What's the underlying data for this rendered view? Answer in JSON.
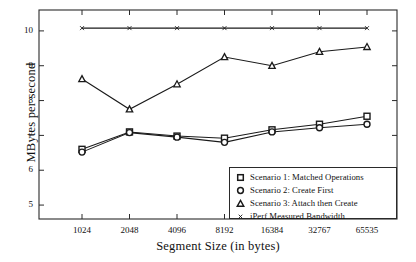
{
  "chart_data": {
    "type": "line",
    "title": "",
    "xlabel": "Segment Size (in bytes)",
    "ylabel": "MBytes per second",
    "categories": [
      "1024",
      "2048",
      "4096",
      "8192",
      "16384",
      "32767",
      "65535"
    ],
    "xticks": [
      "1024",
      "2048",
      "4096",
      "8192",
      "16384",
      "32767",
      "65535"
    ],
    "yticks": [
      "5",
      "6",
      "7",
      "8",
      "9",
      "10"
    ],
    "ylim": [
      4.6,
      10.6
    ],
    "grid": false,
    "legend_position": "lower right",
    "series": [
      {
        "name": "Scenario 1: Matched Operations",
        "marker": "square",
        "values": [
          6.6,
          7.1,
          6.98,
          6.92,
          7.16,
          7.32,
          7.55
        ]
      },
      {
        "name": "Scenario 2: Create First",
        "marker": "circle",
        "values": [
          6.52,
          7.08,
          6.95,
          6.8,
          7.1,
          7.22,
          7.32
        ]
      },
      {
        "name": "Scenario 3: Attach then Create",
        "marker": "triangle",
        "values": [
          8.62,
          7.75,
          8.47,
          9.25,
          9.0,
          9.4,
          9.54
        ]
      },
      {
        "name": "iPerf Measured Bandwidth",
        "marker": "cross",
        "values": [
          10.08,
          10.08,
          10.08,
          10.08,
          10.08,
          10.08,
          10.08
        ]
      }
    ]
  },
  "legend": {
    "entries": [
      {
        "label": "Scenario 1: Matched Operations",
        "marker": "square"
      },
      {
        "label": "Scenario 2: Create First",
        "marker": "circle"
      },
      {
        "label": "Scenario 3: Attach then Create",
        "marker": "triangle"
      },
      {
        "label": "iPerf Measured Bandwidth",
        "marker": "cross"
      }
    ]
  },
  "colors": {
    "line": "#1a1a1a",
    "frame": "#2a2a2a",
    "background": "#ffffff"
  }
}
